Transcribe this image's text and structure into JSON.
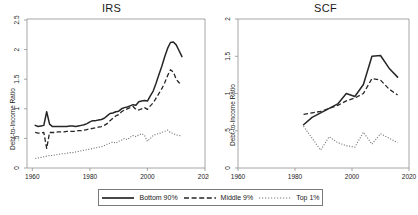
{
  "figure": {
    "panels": [
      {
        "key": "irs",
        "title": "IRS"
      },
      {
        "key": "scf",
        "title": "SCF"
      }
    ],
    "ylabel": "Debt-to-Income Ratio"
  },
  "legend": {
    "entries": [
      {
        "label": "Bottom 90%",
        "style": "solid",
        "color": "#262626"
      },
      {
        "label": "Middle 9%",
        "style": "dashed",
        "color": "#262626"
      },
      {
        "label": "Top 1%",
        "style": "dotted",
        "color": "#777777"
      }
    ]
  },
  "chart_data": [
    {
      "type": "line",
      "title": "IRS",
      "xlabel": "",
      "ylabel": "Debt-to-Income Ratio",
      "xlim": [
        1960,
        2020
      ],
      "ylim": [
        0,
        2.5
      ],
      "xticks": [
        1960,
        1980,
        2000,
        2020
      ],
      "yticks": [
        0,
        0.5,
        1,
        1.5,
        2,
        2.5
      ],
      "ytick_labels": [
        "0",
        ".5",
        "1",
        "1.5",
        "2",
        "2.5"
      ],
      "grid": false,
      "legend_position": "bottom-outside",
      "series": [
        {
          "name": "Bottom 90%",
          "style": "solid",
          "x": [
            1961,
            1962,
            1963,
            1964,
            1965,
            1966,
            1967,
            1968,
            1969,
            1970,
            1971,
            1972,
            1973,
            1974,
            1975,
            1976,
            1977,
            1978,
            1979,
            1980,
            1981,
            1982,
            1983,
            1984,
            1985,
            1986,
            1987,
            1988,
            1989,
            1990,
            1991,
            1992,
            1993,
            1994,
            1995,
            1996,
            1997,
            1998,
            1999,
            2000,
            2001,
            2002,
            2003,
            2004,
            2005,
            2006,
            2007,
            2008,
            2009,
            2010,
            2011,
            2012
          ],
          "values": [
            0.72,
            0.7,
            0.71,
            0.72,
            0.95,
            0.74,
            0.7,
            0.7,
            0.7,
            0.7,
            0.7,
            0.7,
            0.71,
            0.71,
            0.7,
            0.71,
            0.72,
            0.73,
            0.75,
            0.78,
            0.8,
            0.8,
            0.81,
            0.82,
            0.84,
            0.88,
            0.92,
            0.93,
            0.95,
            0.96,
            1.0,
            1.02,
            1.03,
            1.05,
            1.07,
            1.06,
            1.12,
            1.13,
            1.14,
            1.13,
            1.22,
            1.3,
            1.43,
            1.58,
            1.72,
            1.88,
            2.02,
            2.12,
            2.13,
            2.08,
            1.98,
            1.88
          ]
        },
        {
          "name": "Middle 9%",
          "style": "dashed",
          "x": [
            1961,
            1962,
            1963,
            1964,
            1965,
            1966,
            1967,
            1968,
            1969,
            1970,
            1971,
            1972,
            1973,
            1974,
            1975,
            1976,
            1977,
            1978,
            1979,
            1980,
            1981,
            1982,
            1983,
            1984,
            1985,
            1986,
            1987,
            1988,
            1989,
            1990,
            1991,
            1992,
            1993,
            1994,
            1995,
            1996,
            1997,
            1998,
            1999,
            2000,
            2001,
            2002,
            2003,
            2004,
            2005,
            2006,
            2007,
            2008,
            2009,
            2010,
            2011,
            2012
          ],
          "values": [
            0.6,
            0.59,
            0.59,
            0.6,
            0.33,
            0.6,
            0.6,
            0.6,
            0.61,
            0.61,
            0.61,
            0.62,
            0.62,
            0.62,
            0.62,
            0.63,
            0.63,
            0.64,
            0.65,
            0.66,
            0.67,
            0.68,
            0.69,
            0.7,
            0.72,
            0.75,
            0.8,
            0.84,
            0.88,
            0.9,
            0.95,
            0.98,
            1.0,
            1.02,
            1.04,
            0.99,
            0.98,
            1.0,
            1.02,
            0.99,
            1.05,
            1.1,
            1.18,
            1.26,
            1.34,
            1.44,
            1.56,
            1.66,
            1.62,
            1.5,
            1.44,
            1.42
          ]
        },
        {
          "name": "Top 1%",
          "style": "dotted",
          "x": [
            1961,
            1962,
            1963,
            1964,
            1965,
            1966,
            1967,
            1968,
            1969,
            1970,
            1971,
            1972,
            1973,
            1974,
            1975,
            1976,
            1977,
            1978,
            1979,
            1980,
            1981,
            1982,
            1983,
            1984,
            1985,
            1986,
            1987,
            1988,
            1989,
            1990,
            1991,
            1992,
            1993,
            1994,
            1995,
            1996,
            1997,
            1998,
            1999,
            2000,
            2001,
            2002,
            2003,
            2004,
            2005,
            2006,
            2007,
            2008,
            2009,
            2010,
            2011,
            2012
          ],
          "values": [
            0.16,
            0.17,
            0.18,
            0.19,
            0.2,
            0.21,
            0.21,
            0.22,
            0.23,
            0.24,
            0.24,
            0.25,
            0.26,
            0.26,
            0.27,
            0.28,
            0.29,
            0.3,
            0.31,
            0.32,
            0.33,
            0.34,
            0.35,
            0.36,
            0.38,
            0.4,
            0.42,
            0.44,
            0.42,
            0.45,
            0.47,
            0.5,
            0.48,
            0.52,
            0.55,
            0.53,
            0.56,
            0.58,
            0.55,
            0.45,
            0.5,
            0.55,
            0.57,
            0.58,
            0.6,
            0.62,
            0.64,
            0.6,
            0.58,
            0.56,
            0.55,
            0.54
          ]
        }
      ]
    },
    {
      "type": "line",
      "title": "SCF",
      "xlabel": "",
      "ylabel": "Debt-to-Income Ratio",
      "xlim": [
        1960,
        2020
      ],
      "ylim": [
        0,
        2
      ],
      "xticks": [
        1960,
        1980,
        2000,
        2020
      ],
      "yticks": [
        0,
        0.5,
        1,
        1.5,
        2
      ],
      "ytick_labels": [
        "0",
        ".5",
        "1",
        "1.5",
        "2"
      ],
      "grid": false,
      "legend_position": "bottom-outside",
      "series": [
        {
          "name": "Bottom 90%",
          "style": "solid",
          "x": [
            1983,
            1986,
            1989,
            1992,
            1995,
            1998,
            2001,
            2004,
            2007,
            2010,
            2013,
            2016
          ],
          "values": [
            0.58,
            0.68,
            0.74,
            0.8,
            0.86,
            1.0,
            0.96,
            1.12,
            1.5,
            1.51,
            1.34,
            1.22
          ]
        },
        {
          "name": "Middle 9%",
          "style": "dashed",
          "x": [
            1983,
            1986,
            1989,
            1992,
            1995,
            1998,
            2001,
            2004,
            2007,
            2010,
            2013,
            2016
          ],
          "values": [
            0.72,
            0.74,
            0.76,
            0.8,
            0.84,
            0.9,
            0.94,
            1.0,
            1.2,
            1.18,
            1.06,
            0.98
          ]
        },
        {
          "name": "Top 1%",
          "style": "dotted",
          "x": [
            1983,
            1986,
            1989,
            1992,
            1995,
            1998,
            2001,
            2004,
            2007,
            2010,
            2013,
            2016
          ],
          "values": [
            0.56,
            0.4,
            0.24,
            0.42,
            0.34,
            0.3,
            0.28,
            0.48,
            0.32,
            0.46,
            0.4,
            0.34
          ]
        }
      ]
    }
  ]
}
